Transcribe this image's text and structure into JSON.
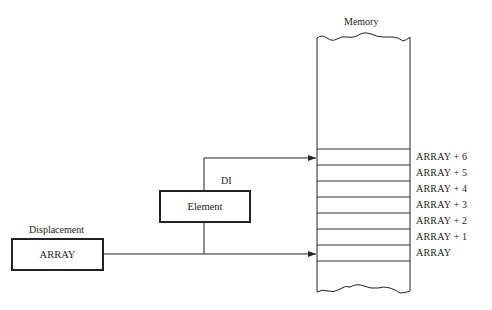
{
  "memory": {
    "title": "Memory",
    "cells": [
      {
        "label": "ARRAY + 6"
      },
      {
        "label": "ARRAY + 5"
      },
      {
        "label": "ARRAY + 4"
      },
      {
        "label": "ARRAY + 3"
      },
      {
        "label": "ARRAY + 2"
      },
      {
        "label": "ARRAY + 1"
      },
      {
        "label": "ARRAY"
      }
    ]
  },
  "element_register": {
    "name": "DI",
    "content": "Element"
  },
  "displacement": {
    "name": "Displacement",
    "content": "ARRAY"
  },
  "colors": {
    "line": "#222222",
    "background": "#ffffff"
  }
}
